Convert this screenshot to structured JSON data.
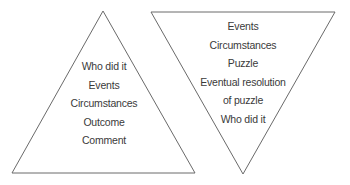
{
  "colors": {
    "stroke": "#6a6a6a",
    "text": "#3a3a3a",
    "background": "#ffffff"
  },
  "pyramid": {
    "shape": "upright-triangle",
    "items": [
      "Who did it",
      "Events",
      "Circumstances",
      "Outcome",
      "Comment"
    ]
  },
  "inverted_pyramid": {
    "shape": "inverted-triangle",
    "items": [
      "Events",
      "Circumstances",
      "Puzzle",
      "Eventual resolution",
      "of puzzle",
      "Who did it"
    ]
  }
}
